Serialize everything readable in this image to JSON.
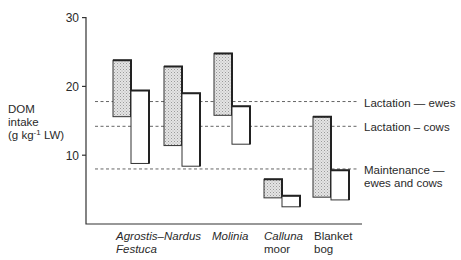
{
  "chart_data": {
    "type": "floating-bar",
    "title": "",
    "xlabel": "",
    "ylabel": "DOM intake (g kg⁻¹ LW)",
    "ylabel_lines": [
      "DOM",
      "intake",
      "(g kg",
      "-1",
      " LW)"
    ],
    "ylim": [
      0,
      30
    ],
    "yticks": [
      10,
      20,
      30
    ],
    "grid": false,
    "legend": "none; series distinguished by fill (shaded = series A, white = series B)",
    "categories": [
      {
        "lines": [
          "Agrostis–",
          "Festuca"
        ],
        "italic": true
      },
      {
        "lines": [
          "Nardus"
        ],
        "italic": true
      },
      {
        "lines": [
          "Molinia"
        ],
        "italic": true
      },
      {
        "lines": [
          "Calluna",
          "moor"
        ],
        "italic_first": true
      },
      {
        "lines": [
          "Blanket",
          "bog"
        ],
        "italic": false
      }
    ],
    "series": [
      {
        "name": "shaded",
        "fill": "stipple-grey",
        "ranges": [
          [
            15.6,
            23.8
          ],
          [
            11.4,
            22.9
          ],
          [
            15.8,
            24.8
          ],
          [
            3.8,
            6.5
          ],
          [
            3.9,
            15.6
          ]
        ]
      },
      {
        "name": "white",
        "fill": "#ffffff",
        "ranges": [
          [
            8.8,
            19.4
          ],
          [
            8.4,
            19.0
          ],
          [
            11.6,
            17.1
          ],
          [
            2.5,
            4.1
          ],
          [
            3.5,
            7.8
          ]
        ]
      }
    ],
    "reference_lines": [
      {
        "value": 17.8,
        "label_lines": [
          "Lactation — ewes"
        ]
      },
      {
        "value": 14.2,
        "label_lines": [
          "Lactation – cows"
        ]
      },
      {
        "value": 8.0,
        "label_lines": [
          "Maintenance —",
          "ewes and cows"
        ]
      }
    ]
  }
}
